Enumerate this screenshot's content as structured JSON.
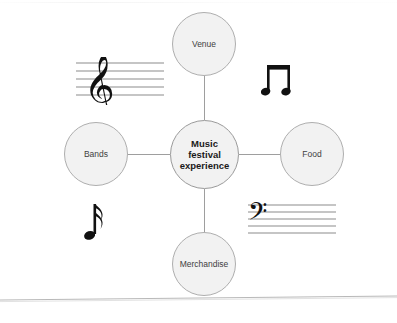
{
  "diagram": {
    "type": "mind-map",
    "title": "Music festival experience",
    "center": {
      "id": "center",
      "label": "Music\nfestival\nexperience"
    },
    "branches": [
      {
        "id": "venue",
        "label": "Venue",
        "position": "top"
      },
      {
        "id": "bands",
        "label": "Bands",
        "position": "left"
      },
      {
        "id": "food",
        "label": "Food",
        "position": "right"
      },
      {
        "id": "merchandise",
        "label": "Merchandise",
        "position": "bottom"
      }
    ],
    "connections": [
      {
        "from": "center",
        "to": "venue"
      },
      {
        "from": "center",
        "to": "bands"
      },
      {
        "from": "center",
        "to": "food"
      },
      {
        "from": "center",
        "to": "merchandise"
      }
    ],
    "decorations": [
      {
        "id": "treble-staff",
        "name": "treble-clef-staff-icon",
        "glyph": "treble clef on five-line staff"
      },
      {
        "id": "bass-staff",
        "name": "bass-clef-staff-icon",
        "glyph": "bass clef on five-line staff"
      },
      {
        "id": "beamed-notes",
        "name": "beamed-eighth-notes-icon",
        "glyph": "beamed pair of eighth notes"
      },
      {
        "id": "single-note",
        "name": "sixteenth-note-icon",
        "glyph": "single flagged note"
      }
    ],
    "colors": {
      "node_fill": "#f2f2f2",
      "node_border": "#aeaeae",
      "center_border": "#9a9a9a",
      "connector": "#9e9e9e",
      "text": "#3f3f3f",
      "center_text": "#1a1a1a",
      "staff_line": "#8c8c8c",
      "note": "#111111",
      "background": "#ffffff",
      "page_edge": "#b9b9b9"
    }
  }
}
